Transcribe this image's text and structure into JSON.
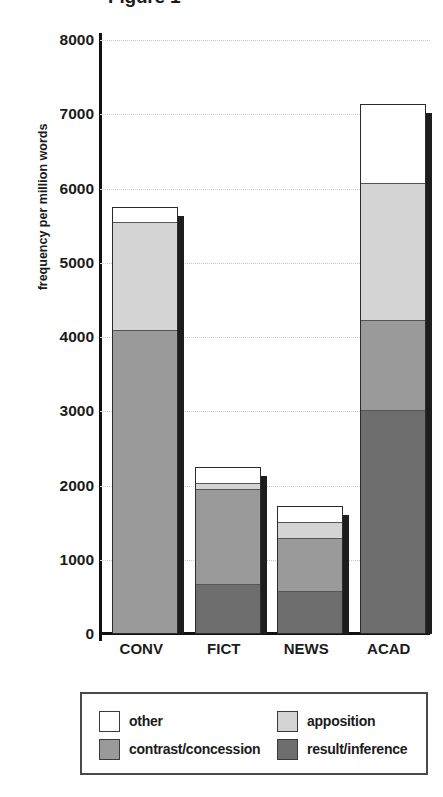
{
  "chart_data": {
    "type": "bar",
    "subtype": "stacked-vertical",
    "title": "Figure 1",
    "xlabel": "",
    "ylabel": "frequency per million words",
    "ylim": [
      0,
      8000
    ],
    "ytick_labels": [
      "8000",
      "7000",
      "6000",
      "5000",
      "4000",
      "3000",
      "2000",
      "1000",
      "0"
    ],
    "ytick_values": [
      8000,
      7000,
      6000,
      5000,
      4000,
      3000,
      2000,
      1000,
      0
    ],
    "grid": true,
    "grid_axis": "y",
    "grid_style": "dotted",
    "legend_position": "bottom",
    "categories": [
      "CONV",
      "FICT",
      "NEWS",
      "ACAD"
    ],
    "stack_order_bottom_to_top": [
      "result/inference",
      "contrast/concession",
      "apposition",
      "other"
    ],
    "series": [
      {
        "name": "result/inference",
        "color": "#6e6e6e",
        "values": [
          0,
          660,
          560,
          3000
        ]
      },
      {
        "name": "contrast/concession",
        "color": "#9a9a9a",
        "values": [
          4080,
          1290,
          730,
          1220
        ]
      },
      {
        "name": "apposition",
        "color": "#d4d4d4",
        "values": [
          1470,
          80,
          210,
          1850
        ]
      },
      {
        "name": "other",
        "color": "#ffffff",
        "values": [
          200,
          220,
          220,
          1070
        ]
      }
    ],
    "totals": [
      5750,
      2250,
      1720,
      7140
    ]
  },
  "legend": {
    "entries": [
      {
        "label": "other",
        "color": "#ffffff"
      },
      {
        "label": "apposition",
        "color": "#d4d4d4"
      },
      {
        "label": "contrast/concession",
        "color": "#9a9a9a"
      },
      {
        "label": "result/inference",
        "color": "#6e6e6e"
      }
    ]
  },
  "colors": {
    "axis": "#111111",
    "grid": "#c9c9c9",
    "text": "#1b1b1b",
    "bar_outline": "#2b2b2b",
    "bar_shadow": "#1d1d1d",
    "legend_border": "#4a4a4a"
  }
}
